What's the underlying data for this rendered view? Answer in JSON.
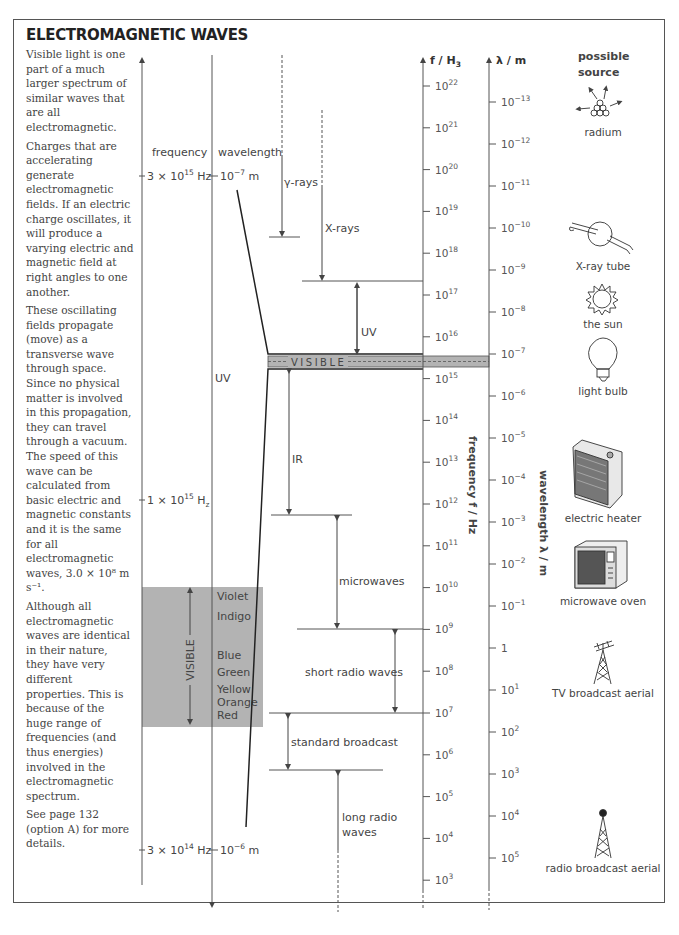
{
  "title": "ELECTROMAGNETIC WAVES",
  "body_paragraphs": [
    "Visible light is one part of a much larger spectrum of similar waves that are all electromagnetic.",
    "Charges that are accelerating generate electromagnetic fields. If an electric charge oscillates, it will produce a varying electric and magnetic field at right angles to one another.",
    "These oscillating fields propagate (move) as a transverse wave through space. Since no physical matter is involved in this propagation, they can travel through a vacuum. The speed of this wave can be calculated from basic electric and magnetic constants and it is the same for all electromagnetic waves, 3.0 × 10⁸ m s⁻¹.",
    "Although all electromagnetic waves are identical in their nature, they have very different properties. This is because of the huge range of frequencies (and thus energies) involved in the electromagnetic spectrum.",
    "See page 132 (option A) for more details."
  ],
  "visible_detail": {
    "frequency_header": "frequency",
    "wavelength_header": "wavelength",
    "top_freq": {
      "base": "3 × 10",
      "exp": "15",
      "unit": " Hz"
    },
    "top_wavelength": {
      "base": "10",
      "exp": "−7",
      "unit": " m"
    },
    "mid_freq": {
      "base": "1 × 10",
      "exp": "15",
      "unit": " H",
      "sub": "z"
    },
    "bottom_freq": {
      "base": "3 × 10",
      "exp": "14",
      "unit": " Hz"
    },
    "bottom_wavelength": {
      "base": "10",
      "exp": "−6",
      "unit": " m"
    },
    "uv_label": "UV",
    "visible_label": "VISIBLE",
    "colors": [
      "Violet",
      "Indigo",
      "Blue",
      "Green",
      "Yellow",
      "Orange",
      "Red"
    ],
    "band_fill": "#b3b3b3"
  },
  "bands": {
    "gamma": "γ-rays",
    "xray": "X-rays",
    "uv": "UV",
    "visible": "VISIBLE",
    "ir": "IR",
    "microwaves": "microwaves",
    "short_radio": "short radio waves",
    "standard_broadcast": "standard broadcast",
    "long_radio_line1": "long radio",
    "long_radio_line2": "waves"
  },
  "frequency_axis": {
    "header_base": "f / H",
    "header_sub": "3",
    "side_label": "frequency f / Hz",
    "ticks": [
      {
        "base": "10",
        "exp": "22"
      },
      {
        "base": "10",
        "exp": "21"
      },
      {
        "base": "10",
        "exp": "20"
      },
      {
        "base": "10",
        "exp": "19"
      },
      {
        "base": "10",
        "exp": "18"
      },
      {
        "base": "10",
        "exp": "17"
      },
      {
        "base": "10",
        "exp": "16"
      },
      {
        "base": "10",
        "exp": "15"
      },
      {
        "base": "10",
        "exp": "14"
      },
      {
        "base": "10",
        "exp": "13"
      },
      {
        "base": "10",
        "exp": "12"
      },
      {
        "base": "10",
        "exp": "11"
      },
      {
        "base": "10",
        "exp": "10"
      },
      {
        "base": "10",
        "exp": "9"
      },
      {
        "base": "10",
        "exp": "8"
      },
      {
        "base": "10",
        "exp": "7"
      },
      {
        "base": "10",
        "exp": "6"
      },
      {
        "base": "10",
        "exp": "5"
      },
      {
        "base": "10",
        "exp": "4"
      },
      {
        "base": "10",
        "exp": "3"
      }
    ]
  },
  "wavelength_axis": {
    "header": "λ / m",
    "side_label": "wavelength λ / m",
    "ticks": [
      {
        "base": "10",
        "exp": "−13"
      },
      {
        "base": "10",
        "exp": "−12"
      },
      {
        "base": "10",
        "exp": "−11"
      },
      {
        "base": "10",
        "exp": "−10"
      },
      {
        "base": "10",
        "exp": "−9"
      },
      {
        "base": "10",
        "exp": "−8"
      },
      {
        "base": "10",
        "exp": "−7"
      },
      {
        "base": "10",
        "exp": "−6"
      },
      {
        "base": "10",
        "exp": "−5"
      },
      {
        "base": "10",
        "exp": "−4"
      },
      {
        "base": "10",
        "exp": "−3"
      },
      {
        "base": "10",
        "exp": "−2"
      },
      {
        "base": "10",
        "exp": "−1"
      },
      {
        "base": "1",
        "exp": ""
      },
      {
        "base": "10",
        "exp": "1"
      },
      {
        "base": "10",
        "exp": "2"
      },
      {
        "base": "10",
        "exp": "3"
      },
      {
        "base": "10",
        "exp": "4"
      },
      {
        "base": "10",
        "exp": "5"
      }
    ]
  },
  "sources": {
    "header_line1": "possible",
    "header_line2": "source",
    "items": [
      {
        "label": "radium",
        "icon": "radium-icon"
      },
      {
        "label": "X-ray tube",
        "icon": "xray-tube-icon"
      },
      {
        "label": "the sun",
        "icon": "sun-icon"
      },
      {
        "label": "light bulb",
        "icon": "light-bulb-icon"
      },
      {
        "label": "electric heater",
        "icon": "electric-heater-icon"
      },
      {
        "label": "microwave oven",
        "icon": "microwave-oven-icon"
      },
      {
        "label": "TV broadcast aerial",
        "icon": "tv-aerial-icon"
      },
      {
        "label": "radio broadcast aerial",
        "icon": "radio-aerial-icon"
      }
    ]
  }
}
